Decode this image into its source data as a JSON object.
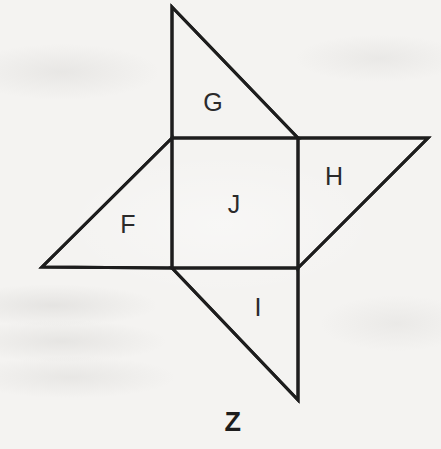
{
  "figure": {
    "caption": "Z",
    "caption_position": {
      "x": 233,
      "y": 422
    },
    "background_color": "#f4f3f1",
    "stroke_color": "#1d1d1d",
    "stroke_width": 3,
    "label_color": "#2a2a2a",
    "center_square": {
      "name": "J",
      "label": "J",
      "label_position": {
        "x": 234,
        "y": 204
      },
      "points": "172,138 298,138 298,268 172,268"
    },
    "triangles": [
      {
        "name": "G",
        "label": "G",
        "position": "top",
        "label_position": {
          "x": 213,
          "y": 102
        },
        "points": "172,7 298,138 172,138"
      },
      {
        "name": "H",
        "label": "H",
        "position": "right",
        "label_position": {
          "x": 334,
          "y": 176
        },
        "points": "298,138 428,138 298,268"
      },
      {
        "name": "I",
        "label": "I",
        "position": "bottom",
        "label_position": {
          "x": 258,
          "y": 307
        },
        "points": "298,268 298,400 172,268"
      },
      {
        "name": "F",
        "label": "F",
        "position": "left",
        "label_position": {
          "x": 128,
          "y": 224
        },
        "points": "172,138 172,268 42,267"
      }
    ],
    "vertices": {
      "square_top_left": {
        "x": 172,
        "y": 138
      },
      "square_top_right": {
        "x": 298,
        "y": 138
      },
      "square_bottom_right": {
        "x": 298,
        "y": 268
      },
      "square_bottom_left": {
        "x": 172,
        "y": 268
      },
      "top_apex": {
        "x": 172,
        "y": 7
      },
      "right_apex": {
        "x": 428,
        "y": 138
      },
      "bottom_apex": {
        "x": 298,
        "y": 400
      },
      "left_apex": {
        "x": 42,
        "y": 267
      }
    },
    "outline_points": "172,7 298,138 428,138 298,268 298,400 172,268 42,267 172,138"
  }
}
